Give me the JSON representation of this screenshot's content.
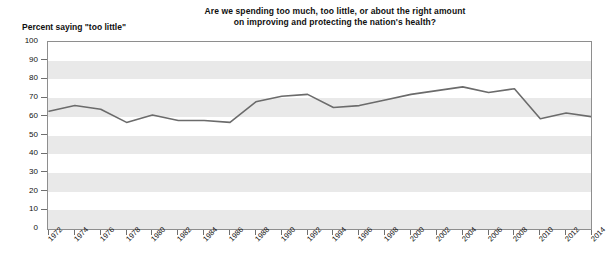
{
  "chart_data": {
    "type": "line",
    "title": "Are we spending too much, too little, or about the right amount on improving and protecting the nation's health?",
    "title_line1": "Are we spending too much, too little, or about the right amount",
    "title_line2": "on improving and protecting the nation's health?",
    "ylabel": "Percent saying \"too little\"",
    "xlabel": "",
    "ylim": [
      0,
      100
    ],
    "ytick_labels": [
      "0",
      "10",
      "20",
      "30",
      "40",
      "50",
      "60",
      "70",
      "80",
      "90",
      "100"
    ],
    "yticks": [
      0,
      10,
      20,
      30,
      40,
      50,
      60,
      70,
      80,
      90,
      100
    ],
    "grid": "horizontal-bands",
    "legend": "none",
    "line_color": "#6b6b6b",
    "band_color": "#e9e9e9",
    "categories": [
      "1972",
      "1974",
      "1976",
      "1978",
      "1980",
      "1982",
      "1984",
      "1986",
      "1988",
      "1990",
      "1992",
      "1994",
      "1996",
      "1998",
      "2000",
      "2002",
      "2004",
      "2006",
      "2008",
      "2010",
      "2012",
      "2014"
    ],
    "x": [
      1972,
      1974,
      1976,
      1978,
      1980,
      1982,
      1984,
      1986,
      1988,
      1990,
      1992,
      1994,
      1996,
      1998,
      2000,
      2002,
      2004,
      2006,
      2008,
      2010,
      2012,
      2014
    ],
    "values": [
      63,
      66,
      64,
      57,
      61,
      58,
      58,
      57,
      68,
      71,
      72,
      65,
      66,
      69,
      72,
      74,
      76,
      73,
      75,
      59,
      62,
      60
    ],
    "series": [
      {
        "name": "Percent saying \"too little\"",
        "values": [
          63,
          66,
          64,
          57,
          61,
          58,
          58,
          57,
          68,
          71,
          72,
          65,
          66,
          69,
          72,
          74,
          76,
          73,
          75,
          59,
          62,
          60
        ]
      }
    ]
  }
}
